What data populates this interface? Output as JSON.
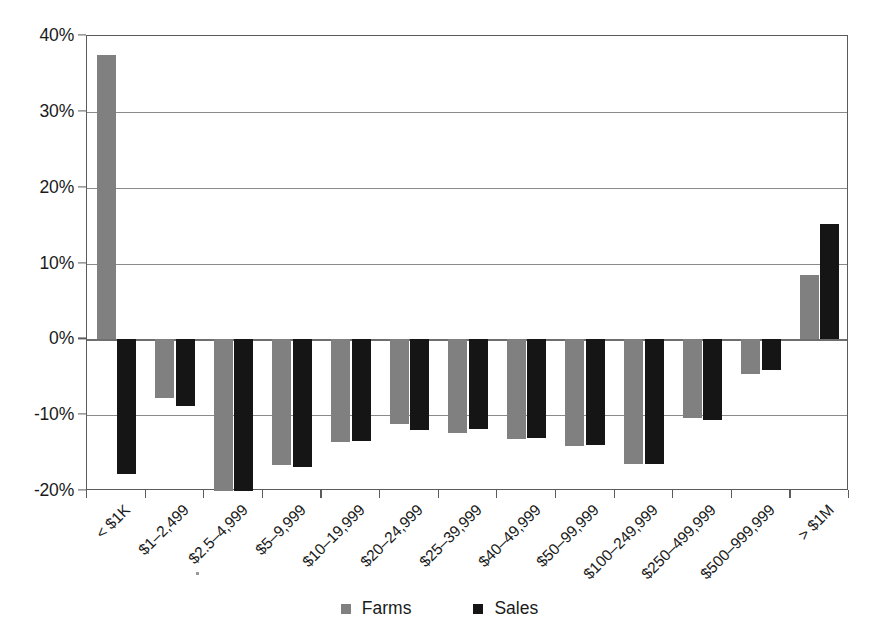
{
  "chart_data": {
    "type": "bar",
    "title": "",
    "subtitle": "",
    "xlabel": "",
    "ylabel": "",
    "ylim": [
      -20,
      40
    ],
    "ytick_values": [
      40,
      30,
      20,
      10,
      0,
      -10,
      -20
    ],
    "ytick_labels": [
      "40%",
      "30%",
      "20%",
      "10%",
      "0%",
      "-10%",
      "-20%"
    ],
    "grid": true,
    "legend_position": "bottom-center",
    "value_unit": "percent",
    "categories": [
      "< $1K",
      "$1–2,499",
      "$2.5–4,999",
      "$5–9,999",
      "$10–19,999",
      "$20–24,999",
      "$25–39,999",
      "$40–49,999",
      "$50–99,999",
      "$100–249,999",
      "$250–499,999",
      "$500–999,999",
      "> $1M"
    ],
    "series": [
      {
        "name": "Farms",
        "color": "#808080",
        "values": [
          37.5,
          -7.7,
          -20.0,
          -16.6,
          -13.6,
          -11.2,
          -12.3,
          -13.1,
          -14.1,
          -16.5,
          -10.4,
          -4.6,
          8.5
        ]
      },
      {
        "name": "Sales",
        "color": "#151515",
        "values": [
          -17.8,
          -8.8,
          -20.0,
          -16.9,
          -13.4,
          -11.9,
          -11.8,
          -13.0,
          -14.0,
          -16.4,
          -10.6,
          -4.0,
          15.2
        ]
      }
    ]
  },
  "legend": {
    "items": [
      {
        "label": "Farms",
        "swatch": "farms-swatch"
      },
      {
        "label": "Sales",
        "swatch": "sales-swatch"
      }
    ]
  }
}
